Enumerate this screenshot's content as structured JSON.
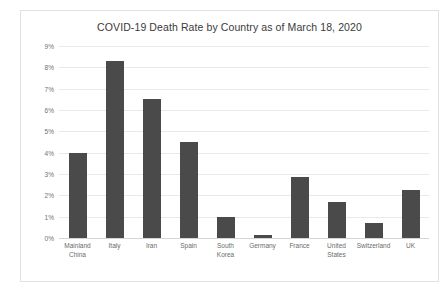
{
  "chart_data": {
    "type": "bar",
    "title": "COVID-19 Death Rate by Country as of March 18, 2020",
    "xlabel": "",
    "ylabel": "",
    "categories": [
      "Mainland China",
      "Italy",
      "Iran",
      "Spain",
      "South Korea",
      "Germany",
      "France",
      "United States",
      "Switzerland",
      "UK"
    ],
    "values": [
      4.0,
      8.3,
      6.5,
      4.5,
      1.0,
      0.15,
      2.85,
      1.7,
      0.7,
      2.25
    ],
    "value_unit": "%",
    "ylim": [
      0,
      9
    ],
    "ytick_labels": [
      "9%",
      "8%",
      "7%",
      "6%",
      "5%",
      "4%",
      "3%",
      "2%",
      "1%",
      "0%"
    ],
    "ytick_values": [
      9,
      8,
      7,
      6,
      5,
      4,
      3,
      2,
      1,
      0
    ],
    "grid": true,
    "legend": false,
    "bar_color": "#4a4a4a",
    "gridline_color": "#e9e9e9",
    "background_color": "#ffffff",
    "border_color": "#e2e2e2"
  }
}
